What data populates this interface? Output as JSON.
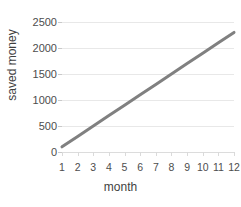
{
  "chart_data": {
    "type": "line",
    "title": "",
    "xlabel": "month",
    "ylabel": "saved money",
    "x": [
      1,
      2,
      3,
      4,
      5,
      6,
      7,
      8,
      9,
      10,
      11,
      12
    ],
    "xtick_labels": [
      "1",
      "2",
      "3",
      "4",
      "5",
      "6",
      "7",
      "8",
      "9",
      "10",
      "11",
      "12"
    ],
    "values": [
      100,
      300,
      500,
      700,
      900,
      1100,
      1300,
      1500,
      1700,
      1900,
      2100,
      2300
    ],
    "series": [
      {
        "name": "saved money",
        "color": "#808080",
        "values": [
          100,
          300,
          500,
          700,
          900,
          1100,
          1300,
          1500,
          1700,
          1900,
          2100,
          2300
        ]
      }
    ],
    "ytick_labels": [
      "0",
      "500",
      "1000",
      "1500",
      "2000",
      "2500"
    ],
    "yticks": [
      0,
      500,
      1000,
      1500,
      2000,
      2500
    ],
    "ylim": [
      0,
      2500
    ],
    "xlim": [
      1,
      12
    ],
    "grid": "horizontal",
    "legend": "none",
    "line_color": "#808080",
    "gridline_color": "#e8e8e8",
    "text_color": "#4d4d4d",
    "background": "#ffffff"
  }
}
